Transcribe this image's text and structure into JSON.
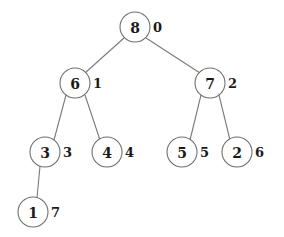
{
  "figure": {
    "background_color": "#ffffff",
    "node_fill_color": "#ffffff",
    "node_stroke_color": "#6f6f6f",
    "edge_color": "#7a7a7a",
    "text_color": "#1a1a1a"
  },
  "chart_data": {
    "type": "diagram",
    "diagram_kind": "binary-tree",
    "title": "",
    "nodes": [
      {
        "id": "n0",
        "value": "8",
        "index": "0",
        "cx": 135,
        "cy": 27,
        "r": 15,
        "label_x": 153,
        "label_y": 27
      },
      {
        "id": "n1",
        "value": "6",
        "index": "1",
        "cx": 75,
        "cy": 83,
        "r": 15,
        "label_x": 93,
        "label_y": 83
      },
      {
        "id": "n2",
        "value": "7",
        "index": "2",
        "cx": 210,
        "cy": 83,
        "r": 15,
        "label_x": 228,
        "label_y": 83
      },
      {
        "id": "n3",
        "value": "3",
        "index": "3",
        "cx": 45,
        "cy": 152,
        "r": 15,
        "label_x": 63,
        "label_y": 152
      },
      {
        "id": "n4",
        "value": "4",
        "index": "4",
        "cx": 107,
        "cy": 152,
        "r": 15,
        "label_x": 125,
        "label_y": 152
      },
      {
        "id": "n5",
        "value": "5",
        "index": "5",
        "cx": 182,
        "cy": 152,
        "r": 15,
        "label_x": 200,
        "label_y": 152
      },
      {
        "id": "n6",
        "value": "2",
        "index": "6",
        "cx": 237,
        "cy": 152,
        "r": 15,
        "label_x": 255,
        "label_y": 152
      },
      {
        "id": "n7",
        "value": "1",
        "index": "7",
        "cx": 33,
        "cy": 212,
        "r": 15,
        "label_x": 51,
        "label_y": 212
      }
    ],
    "edges": [
      {
        "from": "n0",
        "to": "n1",
        "x1": 124,
        "y1": 38,
        "x2": 85,
        "y2": 73
      },
      {
        "from": "n0",
        "to": "n2",
        "x1": 146,
        "y1": 38,
        "x2": 200,
        "y2": 73
      },
      {
        "from": "n1",
        "to": "n3",
        "x1": 66,
        "y1": 95,
        "x2": 54,
        "y2": 140
      },
      {
        "from": "n1",
        "to": "n4",
        "x1": 85,
        "y1": 95,
        "x2": 100,
        "y2": 140
      },
      {
        "from": "n2",
        "to": "n5",
        "x1": 201,
        "y1": 95,
        "x2": 190,
        "y2": 140
      },
      {
        "from": "n2",
        "to": "n6",
        "x1": 219,
        "y1": 95,
        "x2": 230,
        "y2": 140
      },
      {
        "from": "n3",
        "to": "n7",
        "x1": 40,
        "y1": 166,
        "x2": 37,
        "y2": 198
      }
    ],
    "traversal_note": "values inside circles, array indices to the right of each circle"
  }
}
